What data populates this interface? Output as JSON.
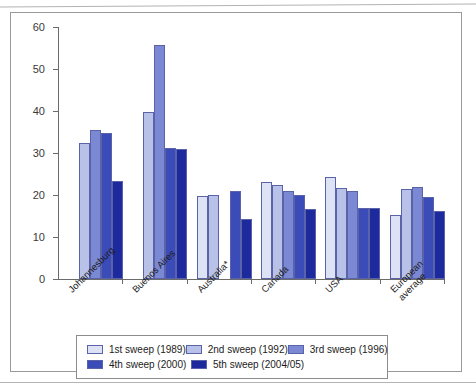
{
  "chart_data": {
    "type": "bar",
    "title": "",
    "xlabel": "",
    "ylabel": "",
    "ylim": [
      0,
      60
    ],
    "yticks": [
      0,
      10,
      20,
      30,
      40,
      50,
      60
    ],
    "grid": false,
    "legend_position": "bottom",
    "categories": [
      "Johannesburg",
      "Buenos Aires",
      "Australia*",
      "Canada",
      "USA",
      "European\naverage"
    ],
    "series": [
      {
        "name": "1st sweep (1989)",
        "color": "#dde3f5",
        "values": [
          null,
          null,
          19.8,
          23.0,
          24.4,
          15.2
        ]
      },
      {
        "name": "2nd sweep (1992)",
        "color": "#b8c2e8",
        "values": [
          32.3,
          39.8,
          20.1,
          22.5,
          21.6,
          21.5
        ]
      },
      {
        "name": "3rd sweep (1996)",
        "color": "#7b88d4",
        "values": [
          35.5,
          55.6,
          null,
          21.0,
          21.0,
          22.0
        ]
      },
      {
        "name": "4th sweep (2000)",
        "color": "#3b4bb8",
        "values": [
          34.8,
          31.3,
          21.0,
          19.9,
          17.0,
          19.6
        ]
      },
      {
        "name": "5th sweep (2004/05)",
        "color": "#1d2a9e",
        "values": [
          23.3,
          31.0,
          14.3,
          16.6,
          17.0,
          16.2
        ]
      }
    ]
  },
  "legend": {
    "rows": [
      [
        "1st sweep (1989)",
        "2nd sweep (1992)",
        "3rd sweep (1996)"
      ],
      [
        "4th sweep (2000)",
        "5th sweep (2004/05)"
      ]
    ]
  }
}
